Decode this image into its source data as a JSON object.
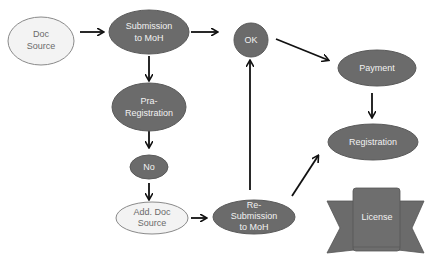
{
  "colors": {
    "dark_node": "#6b6b6b",
    "dark_stroke": "#5a5a5a",
    "light_node": "#f3f3f3",
    "light_stroke": "#8a8a8a",
    "arrow": "#111111",
    "background": "#ffffff"
  },
  "nodes": {
    "doc_source": {
      "line1": "Doc",
      "line2": "Source"
    },
    "submission": {
      "line1": "Submission",
      "line2": "to MoH"
    },
    "pre_registration": {
      "line1": "Pra-",
      "line2": "Registration"
    },
    "no": {
      "label": "No"
    },
    "add_doc_source": {
      "line1": "Add. Doc",
      "line2": "Source"
    },
    "resubmission": {
      "line1": "Re-",
      "line2": "Submission",
      "line3": "to MoH"
    },
    "ok": {
      "label": "OK"
    },
    "payment": {
      "label": "Payment"
    },
    "registration": {
      "label": "Registration"
    },
    "license": {
      "label": "License"
    }
  },
  "edges": [
    {
      "from": "doc_source",
      "to": "submission"
    },
    {
      "from": "submission",
      "to": "ok"
    },
    {
      "from": "submission",
      "to": "pre_registration"
    },
    {
      "from": "pre_registration",
      "to": "no"
    },
    {
      "from": "no",
      "to": "add_doc_source"
    },
    {
      "from": "add_doc_source",
      "to": "resubmission"
    },
    {
      "from": "resubmission",
      "to": "ok"
    },
    {
      "from": "resubmission",
      "to": "registration"
    },
    {
      "from": "ok",
      "to": "payment"
    },
    {
      "from": "payment",
      "to": "registration"
    }
  ]
}
